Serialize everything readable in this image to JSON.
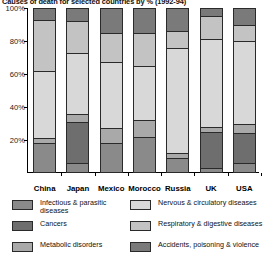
{
  "chart_data": {
    "type": "bar",
    "subtype": "stacked-100-percent",
    "title": "Causes of death for selected countries by % (1992-94)",
    "xlabel": "",
    "ylabel": "",
    "ylim": [
      0,
      100
    ],
    "y_ticks": [
      "20%",
      "40%",
      "60%",
      "80%",
      "100%"
    ],
    "y_tick_values": [
      20,
      40,
      60,
      80,
      100
    ],
    "grid": false,
    "legend_position": "bottom",
    "categories": [
      "China",
      "Japan",
      "Mexico",
      "Morocco",
      "Russia",
      "UK",
      "USA"
    ],
    "series": [
      {
        "name": "Infectious & parasitic diseases",
        "color": "#8a8a8a",
        "values": [
          18,
          6,
          18,
          22,
          9,
          3,
          6
        ]
      },
      {
        "name": "Cancers",
        "color": "#6e6e6e",
        "values": [
          0,
          25,
          0,
          0,
          0,
          22,
          18
        ]
      },
      {
        "name": "Metabolic disorders",
        "color": "#a9a9a9",
        "values": [
          3,
          5,
          9,
          10,
          3,
          3,
          6
        ]
      },
      {
        "name": "Nervous & circulatory diseases",
        "color": "#d8d8d8",
        "values": [
          41,
          37,
          40,
          33,
          64,
          53,
          50
        ]
      },
      {
        "name": "Respiratory & digestive diseases",
        "color": "#c3c3c3",
        "values": [
          31,
          19,
          18,
          20,
          10,
          14,
          10
        ]
      },
      {
        "name": "Accidents, poisoning & violence",
        "color": "#7a7a7a",
        "values": [
          7,
          8,
          15,
          15,
          14,
          5,
          10
        ]
      }
    ]
  },
  "legend": {
    "items": [
      {
        "label": "Infectious & parasitic\ndiseases",
        "swatch": "#8a8a8a",
        "column": "left"
      },
      {
        "label": "Cancers",
        "swatch": "#6e6e6e",
        "column": "left"
      },
      {
        "label": "Metabolic disorders",
        "swatch": "#a9a9a9",
        "column": "left"
      },
      {
        "label": "Nervous & circulatory diseases",
        "swatch": "#d8d8d8",
        "column": "right"
      },
      {
        "label": "Respiratory & digestive diseases",
        "swatch": "#c3c3c3",
        "column": "right"
      },
      {
        "label": "Accidents, poisoning & violence",
        "swatch": "#7a7a7a",
        "column": "right"
      }
    ]
  },
  "colors": {
    "axis": "#000000",
    "text": "#111111",
    "background": "#ffffff",
    "segment_border": "#2a2a2a"
  }
}
